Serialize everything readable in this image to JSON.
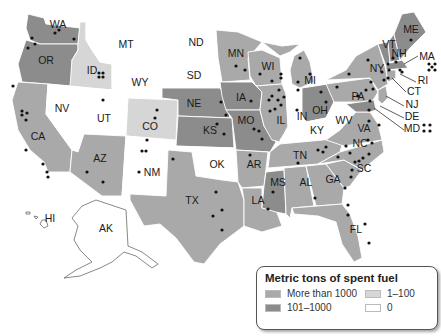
{
  "colors": {
    "more_than_1000": "#a9a9a9",
    "range_101_1000": "#8c8c8c",
    "range_1_100": "#d6d6d6",
    "zero": "#ffffff",
    "dot": "#111111"
  },
  "legend": {
    "title": "Metric tons of spent fuel",
    "items": [
      {
        "label": "More than 1000",
        "color": "#a9a9a9"
      },
      {
        "label": "1–100",
        "color": "#d6d6d6"
      },
      {
        "label": "101–1000",
        "color": "#8c8c8c"
      },
      {
        "label": "0",
        "color": "#ffffff"
      }
    ]
  },
  "states": {
    "WA": {
      "label": "WA",
      "category": "101–1000"
    },
    "OR": {
      "label": "OR",
      "category": "101–1000"
    },
    "CA": {
      "label": "CA",
      "category": "More than 1000"
    },
    "ID": {
      "label": "ID",
      "category": "1–100"
    },
    "NV": {
      "label": "NV",
      "category": "0"
    },
    "UT": {
      "label": "UT",
      "category": "0"
    },
    "AZ": {
      "label": "AZ",
      "category": "More than 1000"
    },
    "MT": {
      "label": "MT",
      "category": "0"
    },
    "WY": {
      "label": "WY",
      "category": "0"
    },
    "CO": {
      "label": "CO",
      "category": "1–100"
    },
    "NM": {
      "label": "NM",
      "category": "0"
    },
    "ND": {
      "label": "ND",
      "category": "0"
    },
    "SD": {
      "label": "SD",
      "category": "0"
    },
    "NE": {
      "label": "NE",
      "category": "101–1000"
    },
    "KS": {
      "label": "KS",
      "category": "101–1000"
    },
    "OK": {
      "label": "OK",
      "category": "0"
    },
    "TX": {
      "label": "TX",
      "category": "More than 1000"
    },
    "MN": {
      "label": "MN",
      "category": "More than 1000"
    },
    "IA": {
      "label": "IA",
      "category": "101–1000"
    },
    "MO": {
      "label": "MO",
      "category": "101–1000"
    },
    "AR": {
      "label": "AR",
      "category": "More than 1000"
    },
    "LA": {
      "label": "LA",
      "category": "More than 1000"
    },
    "WI": {
      "label": "WI",
      "category": "More than 1000"
    },
    "IL": {
      "label": "IL",
      "category": "More than 1000"
    },
    "MS": {
      "label": "MS",
      "category": "101–1000"
    },
    "MI": {
      "label": "MI",
      "category": "More than 1000"
    },
    "IN": {
      "label": "IN",
      "category": "0"
    },
    "OH": {
      "label": "OH",
      "category": "101–1000"
    },
    "KY": {
      "label": "KY",
      "category": "0"
    },
    "TN": {
      "label": "TN",
      "category": "More than 1000"
    },
    "AL": {
      "label": "AL",
      "category": "More than 1000"
    },
    "GA": {
      "label": "GA",
      "category": "More than 1000"
    },
    "FL": {
      "label": "FL",
      "category": "More than 1000"
    },
    "SC": {
      "label": "SC",
      "category": "More than 1000"
    },
    "NC": {
      "label": "NC",
      "category": "More than 1000"
    },
    "VA": {
      "label": "VA",
      "category": "More than 1000"
    },
    "WV": {
      "label": "WV",
      "category": "0"
    },
    "PA": {
      "label": "PA",
      "category": "More than 1000"
    },
    "NY": {
      "label": "NY",
      "category": "More than 1000"
    },
    "VT": {
      "label": "VT",
      "category": "101–1000"
    },
    "NH": {
      "label": "NH",
      "category": "101–1000"
    },
    "ME": {
      "label": "ME",
      "category": "101–1000"
    },
    "MA": {
      "label": "MA",
      "category": "101–1000"
    },
    "RI": {
      "label": "RI",
      "category": "0"
    },
    "CT": {
      "label": "CT",
      "category": "More than 1000"
    },
    "NJ": {
      "label": "NJ",
      "category": "More than 1000"
    },
    "DE": {
      "label": "DE",
      "category": "0"
    },
    "MD": {
      "label": "MD",
      "category": "101–1000"
    },
    "HI": {
      "label": "HI",
      "category": "0"
    },
    "AK": {
      "label": "AK",
      "category": "0"
    }
  }
}
